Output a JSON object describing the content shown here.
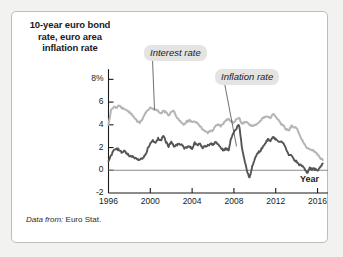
{
  "figure": {
    "title": "10-year euro bond rate, euro area inflation rate",
    "title_lines": [
      "10-year euro bond",
      "rate, euro area",
      "inflation rate"
    ],
    "source_prefix": "Data from:",
    "source_value": "Euro Stat.",
    "x_axis_name": "Year",
    "annotations": {
      "interest": "Interest rate",
      "inflation": "Inflation rate"
    },
    "colors": {
      "interest_line": "#b5b5b3",
      "inflation_line": "#555555",
      "axis": "#1a1a1a",
      "zero_line": "#8a8a8a",
      "card_background": "#ffffff",
      "page_background": "#f2f2f0",
      "annotation_background": "#e4e4e2"
    }
  },
  "chart_data": {
    "type": "line",
    "title": "10-year euro bond rate, euro area inflation rate",
    "xlabel": "Year",
    "ylabel": "",
    "ylim": [
      -2,
      9
    ],
    "xlim": [
      1996,
      2017
    ],
    "grid": false,
    "legend_position": "inline-annotations",
    "y_ticks": [
      -2,
      0,
      2,
      4,
      6,
      8
    ],
    "y_tick_labels": [
      "-2",
      "0",
      "2",
      "4",
      "6",
      "8%"
    ],
    "x_ticks": [
      1996,
      2000,
      2004,
      2008,
      2012,
      2016
    ],
    "x_tick_labels": [
      "1996",
      "2000",
      "2004",
      "2008",
      "2012",
      "2016"
    ],
    "zero_line": 0,
    "units": "percent",
    "series": [
      {
        "name": "Interest rate",
        "color": "#b5b5b3",
        "x": [
          1996.0,
          1996.25,
          1996.5,
          1996.75,
          1997.0,
          1997.25,
          1997.5,
          1997.75,
          1998.0,
          1998.25,
          1998.5,
          1998.75,
          1999.0,
          1999.25,
          1999.5,
          1999.75,
          2000.0,
          2000.25,
          2000.5,
          2000.75,
          2001.0,
          2001.25,
          2001.5,
          2001.75,
          2002.0,
          2002.25,
          2002.5,
          2002.75,
          2003.0,
          2003.25,
          2003.5,
          2003.75,
          2004.0,
          2004.25,
          2004.5,
          2004.75,
          2005.0,
          2005.25,
          2005.5,
          2005.75,
          2006.0,
          2006.25,
          2006.5,
          2006.75,
          2007.0,
          2007.25,
          2007.5,
          2007.75,
          2008.0,
          2008.25,
          2008.5,
          2008.75,
          2009.0,
          2009.25,
          2009.5,
          2009.75,
          2010.0,
          2010.25,
          2010.5,
          2010.75,
          2011.0,
          2011.25,
          2011.5,
          2011.75,
          2012.0,
          2012.25,
          2012.5,
          2012.75,
          2013.0,
          2013.25,
          2013.5,
          2013.75,
          2014.0,
          2014.25,
          2014.5,
          2014.75,
          2015.0,
          2015.25,
          2015.5,
          2015.75,
          2016.0,
          2016.25,
          2016.5
        ],
        "y": [
          4.0,
          5.3,
          5.6,
          5.5,
          5.7,
          5.5,
          5.4,
          5.3,
          5.1,
          4.9,
          4.6,
          4.3,
          4.2,
          4.5,
          5.0,
          5.3,
          5.5,
          5.4,
          5.3,
          5.2,
          5.0,
          5.2,
          5.1,
          4.8,
          5.1,
          5.2,
          4.7,
          4.4,
          4.2,
          4.0,
          4.3,
          4.4,
          4.2,
          4.3,
          4.2,
          3.9,
          3.6,
          3.4,
          3.3,
          3.5,
          3.5,
          4.0,
          4.0,
          3.9,
          4.1,
          4.4,
          4.5,
          4.3,
          4.2,
          4.5,
          4.6,
          4.1,
          4.2,
          4.3,
          4.0,
          3.9,
          4.0,
          4.1,
          4.3,
          4.6,
          4.7,
          4.7,
          4.6,
          5.0,
          4.7,
          4.5,
          4.1,
          3.9,
          3.6,
          3.5,
          3.9,
          3.8,
          3.7,
          3.2,
          2.7,
          2.3,
          1.9,
          1.9,
          1.8,
          1.6,
          1.4,
          1.1,
          0.9
        ]
      },
      {
        "name": "Inflation rate",
        "color": "#555555",
        "x": [
          1996.0,
          1996.25,
          1996.5,
          1996.75,
          1997.0,
          1997.25,
          1997.5,
          1997.75,
          1998.0,
          1998.25,
          1998.5,
          1998.75,
          1999.0,
          1999.25,
          1999.5,
          1999.75,
          2000.0,
          2000.25,
          2000.5,
          2000.75,
          2001.0,
          2001.25,
          2001.5,
          2001.75,
          2002.0,
          2002.25,
          2002.5,
          2002.75,
          2003.0,
          2003.25,
          2003.5,
          2003.75,
          2004.0,
          2004.25,
          2004.5,
          2004.75,
          2005.0,
          2005.25,
          2005.5,
          2005.75,
          2006.0,
          2006.25,
          2006.5,
          2006.75,
          2007.0,
          2007.25,
          2007.5,
          2007.75,
          2008.0,
          2008.25,
          2008.5,
          2008.75,
          2009.0,
          2009.25,
          2009.5,
          2009.75,
          2010.0,
          2010.25,
          2010.5,
          2010.75,
          2011.0,
          2011.25,
          2011.5,
          2011.75,
          2012.0,
          2012.25,
          2012.5,
          2012.75,
          2013.0,
          2013.25,
          2013.5,
          2013.75,
          2014.0,
          2014.25,
          2014.5,
          2014.75,
          2015.0,
          2015.25,
          2015.5,
          2015.75,
          2016.0,
          2016.25,
          2016.5
        ],
        "y": [
          0.8,
          1.3,
          1.7,
          1.9,
          1.8,
          1.6,
          1.7,
          1.5,
          1.3,
          1.2,
          1.1,
          0.9,
          1.0,
          1.1,
          1.3,
          1.9,
          2.3,
          2.6,
          2.5,
          2.8,
          2.6,
          3.0,
          2.5,
          2.1,
          2.5,
          2.1,
          2.2,
          2.3,
          2.3,
          1.9,
          2.0,
          2.1,
          1.9,
          2.4,
          2.2,
          2.3,
          2.0,
          2.1,
          2.2,
          2.3,
          2.3,
          2.5,
          2.3,
          1.9,
          1.8,
          1.9,
          1.8,
          2.9,
          3.3,
          3.7,
          4.0,
          2.1,
          1.0,
          -0.1,
          -0.7,
          0.4,
          1.0,
          1.5,
          1.7,
          2.0,
          2.4,
          2.7,
          2.6,
          3.0,
          2.7,
          2.5,
          2.6,
          2.3,
          1.9,
          1.4,
          1.3,
          0.9,
          0.8,
          0.5,
          0.4,
          0.2,
          -0.3,
          0.2,
          0.1,
          0.1,
          0.0,
          0.3,
          0.6
        ]
      }
    ],
    "annotations": [
      {
        "text": "Interest rate",
        "target_x": 2000.4,
        "target_y": 5.35,
        "style": "boxed-italic-with-leader"
      },
      {
        "text": "Inflation rate",
        "target_x": 2008.2,
        "target_y": 2.2,
        "style": "boxed-italic-with-leader"
      }
    ]
  }
}
